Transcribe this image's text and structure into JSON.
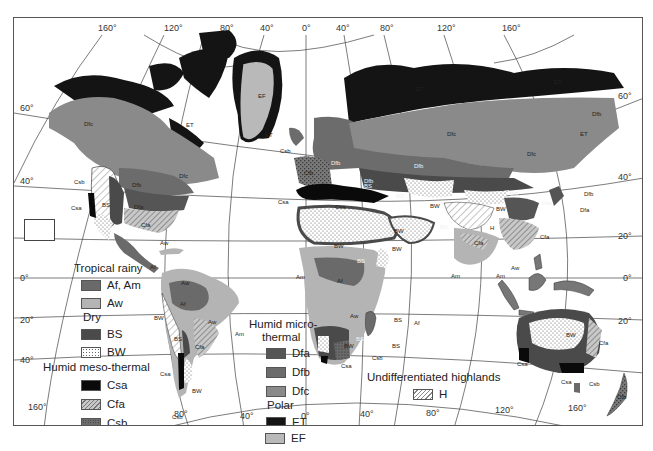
{
  "map": {
    "title": "World climate regions (Köppen classification)",
    "top_longitude_labels": [
      "160°",
      "120°",
      "80°",
      "40°",
      "0°",
      "40°",
      "80°",
      "120°",
      "160°"
    ],
    "bottom_longitude_labels": [
      "160°",
      "80°",
      "40°",
      "0°",
      "40°",
      "80°",
      "120°",
      "160°"
    ],
    "left_latitude_labels": [
      "60°",
      "40°",
      "20°",
      "0°",
      "20°",
      "40°"
    ],
    "right_latitude_labels": [
      "60°",
      "40°",
      "20°",
      "0°",
      "20°"
    ],
    "region_labels": {
      "greenland": "EF",
      "greenland_south": "ET",
      "iceland": "Csb",
      "canada_arctic": "ET",
      "alaska_canada": "Dfc",
      "canada_east": "Dfc",
      "na_dfb": "Dfb",
      "na_dfa": "Dfa",
      "na_cfa": "Cfa",
      "na_bs": "BS",
      "na_csb": "Csb",
      "na_csa": "Csa",
      "caribbean_aw": "Aw",
      "central_america_af": "Af",
      "sa_aw_north": "Aw",
      "sa_af": "Af",
      "sa_aw": "Aw",
      "sa_bw_north": "BW",
      "sa_bs": "BS",
      "sa_am": "Am",
      "sa_cfa": "Cfa",
      "sa_csa": "Csa",
      "sa_bw": "BW",
      "sa_csb": "Csb",
      "europe_dfb": "Dfb",
      "europe_cfb": "Cfb",
      "europe_csa_west": "Csa",
      "europe_csa_med": "Csa",
      "europe_bs": "BS",
      "siberia_et_west": "ET",
      "siberia_et_east": "ET",
      "siberia_dfc": "Dfc",
      "siberia_dfc_east": "Dfc",
      "russia_dfb": "Dfb",
      "russia_dfb_south": "Dfb",
      "kamchatka_dfb": "Dfb",
      "kamchatka_et": "ET",
      "asia_bs_central": "BS",
      "asia_bw_central": "BW",
      "asia_bs_east": "BS",
      "asia_bw_gobi": "BW",
      "asia_bs_south": "BS",
      "tibet_h": "H",
      "china_dfa": "Dfa",
      "japan_dfb": "Dfb",
      "japan_dfa": "Dfa",
      "china_cfa": "Cfa",
      "india_cfa": "Cfa",
      "arabia_bw": "BW",
      "india_am": "Am",
      "seasia_am": "Am",
      "seasia_aw": "Aw",
      "africa_bw": "BW",
      "africa_bs": "BS",
      "africa_am": "Am",
      "africa_af": "Af",
      "africa_aw": "Aw",
      "africa_bw_horn": "BW",
      "africa_bs_south": "BS",
      "africa_bw_south": "BW",
      "africa_csa": "Csa",
      "africa_csb": "Csb",
      "madagascar_bs_north": "BS",
      "madagascar_af": "Af",
      "madagascar_bs_south": "BS",
      "australia_bw": "BW",
      "australia_bs": "BS",
      "australia_cfa": "Cfa",
      "australia_csa_west": "Csa",
      "australia_csa_south": "Csa",
      "australia_csb": "Csb",
      "new_zealand_cfb": "Cfb"
    }
  },
  "legend": {
    "groups": [
      {
        "heading": "Tropical rainy",
        "items": [
          {
            "code": "Af, Am",
            "color": "#6a6a6a",
            "pattern": "solid"
          },
          {
            "code": "Aw",
            "color": "#b4b4b4",
            "pattern": "solid"
          }
        ]
      },
      {
        "heading": "Dry",
        "items": [
          {
            "code": "BS",
            "color": "#4a4a4a",
            "pattern": "solid"
          },
          {
            "code": "BW",
            "color": "#ffffff",
            "pattern": "dots"
          }
        ]
      },
      {
        "heading": "Humid meso-thermal",
        "items": [
          {
            "code": "Csa",
            "color": "#0a0a0a",
            "pattern": "solid"
          },
          {
            "code": "Cfa",
            "color": "#bdbdbd",
            "pattern": "hatch"
          },
          {
            "code": "Csb",
            "color": "#6e6e6e",
            "pattern": "dots-dark"
          }
        ]
      },
      {
        "heading": "Humid micro-thermal",
        "heading_line2": "thermal",
        "heading_line1": "Humid micro-",
        "items": [
          {
            "code": "Dfa",
            "color": "#555555",
            "pattern": "solid"
          },
          {
            "code": "Dfb",
            "color": "#6c6c6c",
            "pattern": "solid"
          },
          {
            "code": "Dfc",
            "color": "#8a8a8a",
            "pattern": "solid"
          }
        ]
      },
      {
        "heading": "Polar",
        "items": [
          {
            "code": "ET",
            "color": "#141414",
            "pattern": "solid"
          },
          {
            "code": "EF",
            "color": "#b9b9b9",
            "pattern": "solid"
          }
        ]
      },
      {
        "heading": "Undifferentiated highlands",
        "items": [
          {
            "code": "H",
            "color": "#ffffff",
            "pattern": "hatch-light"
          }
        ]
      }
    ]
  }
}
